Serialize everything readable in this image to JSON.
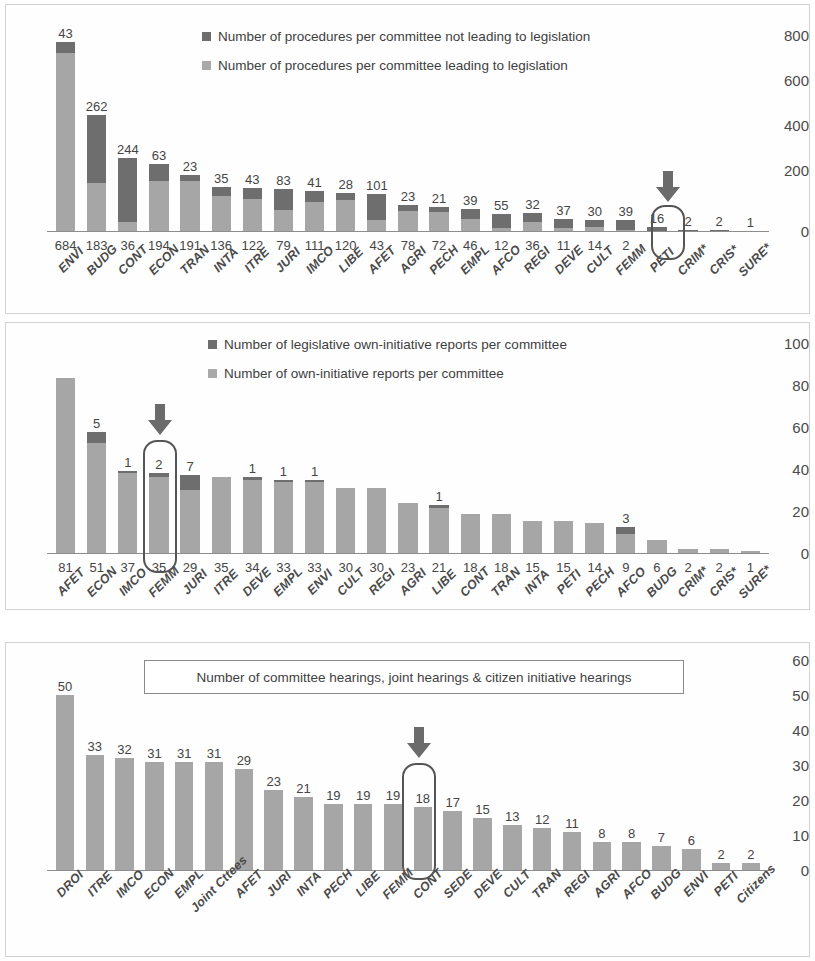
{
  "colors": {
    "dark": "#6e6e6e",
    "light": "#a6a6a6",
    "axis": "#8d8d8d",
    "highlight": "#555555",
    "arrow": "#6b6b6b"
  },
  "charts": [
    {
      "id": "chart-procedures",
      "legend": [
        {
          "swatch": "dark",
          "label": "Number of procedures per committee not leading to legislation"
        },
        {
          "swatch": "light",
          "label": "Number of procedures per committee leading to legislation"
        }
      ],
      "highlight_category": "FEMM",
      "yticks": [
        "800",
        "600",
        "400",
        "200",
        "0"
      ],
      "chart_data": {
        "type": "bar",
        "subtype": "stacked",
        "title": "",
        "xlabel": "",
        "ylabel": "",
        "ylim": [
          0,
          800
        ],
        "grid": false,
        "legend_position": "top-center",
        "categories": [
          "ENVI",
          "BUDG",
          "CONT",
          "ECON",
          "TRAN",
          "INTA",
          "ITRE",
          "JURI",
          "IMCO",
          "LIBE",
          "AFET",
          "AGRI",
          "PECH",
          "EMPL",
          "AFCO",
          "REGI",
          "DEVE",
          "CULT",
          "FEMM",
          "PETI",
          "CRIM*",
          "CRIS*",
          "SURE*"
        ],
        "series": [
          {
            "name": "Number of procedures per committee leading to legislation",
            "values": [
              684,
              183,
              36,
              194,
              191,
              136,
              122,
              79,
              111,
              120,
              43,
              78,
              72,
              46,
              12,
              36,
              11,
              14,
              2,
              0,
              0,
              0,
              0
            ]
          },
          {
            "name": "Number of procedures per committee not leading to legislation",
            "values": [
              43,
              262,
              244,
              63,
              23,
              35,
              43,
              83,
              41,
              28,
              101,
              23,
              21,
              39,
              55,
              32,
              37,
              30,
              39,
              16,
              2,
              2,
              1
            ]
          }
        ],
        "top_labels": [
          "43",
          "262",
          "244",
          "63",
          "23",
          "35",
          "43",
          "83",
          "41",
          "28",
          "101",
          "23",
          "21",
          "39",
          "55",
          "32",
          "37",
          "30",
          "39",
          "16",
          "2",
          "2",
          "1"
        ],
        "bottom_labels": [
          "684",
          "183",
          "36",
          "194",
          "191",
          "136",
          "122",
          "79",
          "111",
          "120",
          "43",
          "78",
          "72",
          "46",
          "12",
          "36",
          "11",
          "14",
          "2",
          "",
          "",
          "",
          ""
        ]
      }
    },
    {
      "id": "chart-own-initiative",
      "legend": [
        {
          "swatch": "dark",
          "label": "Number of legislative own-initiative reports per committee"
        },
        {
          "swatch": "light",
          "label": "Number of own-initiative reports per committee"
        }
      ],
      "highlight_category": "FEMM",
      "yticks": [
        "100",
        "80",
        "60",
        "40",
        "20",
        "0"
      ],
      "chart_data": {
        "type": "bar",
        "subtype": "stacked",
        "title": "",
        "xlabel": "",
        "ylabel": "",
        "ylim": [
          0,
          100
        ],
        "grid": false,
        "legend_position": "top-center",
        "categories": [
          "AFET",
          "ECON",
          "IMCO",
          "FEMM",
          "JURI",
          "ITRE",
          "DEVE",
          "EMPL",
          "ENVI",
          "CULT",
          "REGI",
          "AGRI",
          "LIBE",
          "CONT",
          "TRAN",
          "INTA",
          "PETI",
          "PECH",
          "AFCO",
          "BUDG",
          "CRIM*",
          "CRIS*",
          "SURE*"
        ],
        "series": [
          {
            "name": "Number of own-initiative reports per committee",
            "values": [
              81,
              51,
              37,
              35,
              29,
              35,
              34,
              33,
              33,
              30,
              30,
              23,
              21,
              18,
              18,
              15,
              15,
              14,
              9,
              6,
              2,
              2,
              1
            ]
          },
          {
            "name": "Number of legislative own-initiative reports per committee",
            "values": [
              0,
              5,
              1,
              2,
              7,
              0,
              1,
              1,
              1,
              0,
              0,
              0,
              1,
              0,
              0,
              0,
              0,
              0,
              3,
              0,
              0,
              0,
              0
            ]
          }
        ],
        "top_labels": [
          "",
          "5",
          "1",
          "2",
          "7",
          "",
          "1",
          "1",
          "1",
          "",
          "",
          "",
          "1",
          "",
          "",
          "",
          "",
          "",
          "3",
          "",
          "",
          "",
          ""
        ],
        "bottom_labels": [
          "81",
          "51",
          "37",
          "35",
          "29",
          "35",
          "34",
          "33",
          "33",
          "30",
          "30",
          "23",
          "21",
          "18",
          "18",
          "15",
          "15",
          "14",
          "9",
          "6",
          "2",
          "2",
          "1"
        ]
      }
    },
    {
      "id": "chart-hearings",
      "title_box": "Number of committee hearings, joint hearings & citizen initiative hearings",
      "highlight_category": "FEMM",
      "yticks": [
        "60",
        "50",
        "40",
        "30",
        "20",
        "10",
        "0"
      ],
      "chart_data": {
        "type": "bar",
        "subtype": "simple",
        "title": "Number of committee hearings, joint hearings & citizen initiative hearings",
        "xlabel": "",
        "ylabel": "",
        "ylim": [
          0,
          60
        ],
        "grid": false,
        "legend_position": "none",
        "categories": [
          "DROI",
          "ITRE",
          "IMCO",
          "ECON",
          "EMPL",
          "Joint Cttees",
          "AFET",
          "JURI",
          "INTA",
          "PECH",
          "LIBE",
          "FEMM",
          "CONT",
          "SEDE",
          "DEVE",
          "CULT",
          "TRAN",
          "REGI",
          "AGRI",
          "AFCO",
          "BUDG",
          "ENVI",
          "PETI",
          "Citizens"
        ],
        "values": [
          50,
          33,
          32,
          31,
          31,
          31,
          29,
          23,
          21,
          19,
          19,
          19,
          18,
          17,
          15,
          13,
          12,
          11,
          8,
          8,
          7,
          6,
          2,
          2
        ],
        "top_labels": [
          "50",
          "33",
          "32",
          "31",
          "31",
          "31",
          "29",
          "23",
          "21",
          "19",
          "19",
          "19",
          "18",
          "17",
          "15",
          "13",
          "12",
          "11",
          "8",
          "8",
          "7",
          "6",
          "2",
          "2"
        ]
      }
    }
  ]
}
